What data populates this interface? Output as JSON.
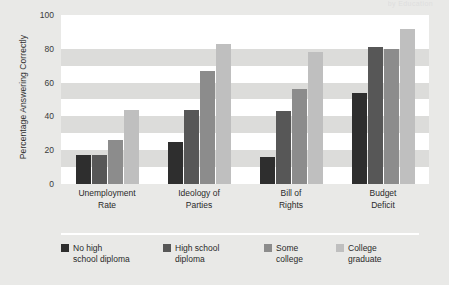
{
  "title_fragment": "by Education",
  "chart_data": {
    "type": "bar",
    "title": "",
    "xlabel": "",
    "ylabel": "Percentage Answering Correctly",
    "ylim": [
      0,
      100
    ],
    "yticks": [
      100,
      80,
      60,
      40,
      20,
      0
    ],
    "grid": "horizontal-bands",
    "legend_position": "bottom",
    "categories": [
      "Unemployment Rate",
      "Ideology of Parties",
      "Bill of Rights",
      "Budget Deficit"
    ],
    "category_lines": [
      [
        "Unemployment",
        "Rate"
      ],
      [
        "Ideology of",
        "Parties"
      ],
      [
        "Bill of",
        "Rights"
      ],
      [
        "Budget",
        "Deficit"
      ]
    ],
    "series": [
      {
        "name": "No high school diploma",
        "name_lines": [
          "No high",
          "school diploma"
        ],
        "color": "#2e2e2e",
        "values": [
          17,
          25,
          16,
          54
        ]
      },
      {
        "name": "High school diploma",
        "name_lines": [
          "High school",
          "diploma"
        ],
        "color": "#575757",
        "values": [
          17,
          44,
          43,
          81
        ]
      },
      {
        "name": "Some college",
        "name_lines": [
          "Some",
          "college"
        ],
        "color": "#8c8c8c",
        "values": [
          26,
          67,
          56,
          80
        ]
      },
      {
        "name": "College graduate",
        "name_lines": [
          "College",
          "graduate"
        ],
        "color": "#bfbfbf",
        "values": [
          44,
          83,
          78,
          92
        ]
      }
    ]
  }
}
